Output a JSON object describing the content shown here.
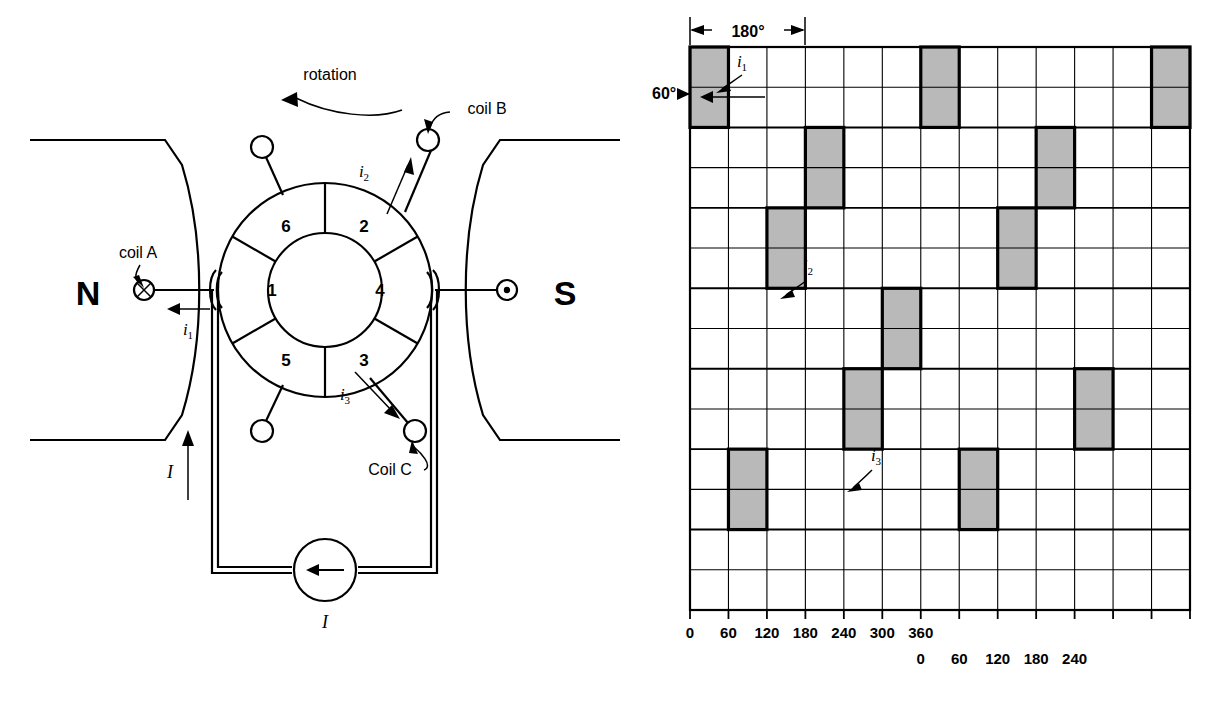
{
  "figure": {
    "title_left": "DC machine cross-section with ring armature",
    "title_right": "Coil current timing diagram"
  },
  "left_diagram": {
    "name": "dc-machine-cross-section",
    "rotation_label": "rotation",
    "pole_north": "N",
    "pole_south": "S",
    "coil_a_label": "coil A",
    "coil_b_label": "coil B",
    "coil_c_label": "Coil C",
    "current_i1": "i",
    "current_i1_sub": "1",
    "current_i2": "i",
    "current_i2_sub": "2",
    "current_i3": "i",
    "current_i3_sub": "3",
    "current_I_side": "I",
    "current_I_source": "I",
    "segment_numbers": [
      "1",
      "2",
      "3",
      "4",
      "5",
      "6"
    ],
    "segment_positions": {
      "1": "left",
      "2": "upper-right",
      "3": "lower-right",
      "4": "right",
      "5": "lower-left",
      "6": "upper-left"
    },
    "brush_left_symbol": "cross-in-circle",
    "brush_right_symbol": "dot-in-circle"
  },
  "right_diagram": {
    "name": "coil-current-timing-grid",
    "dim_180_label": "180°",
    "dim_60_label": "60°",
    "trace_labels": [
      {
        "text": "i",
        "sub": "1"
      },
      {
        "text": "i",
        "sub": "2"
      },
      {
        "text": "i",
        "sub": "3"
      }
    ],
    "axis_top_ticks": [
      "0",
      "60",
      "120",
      "180",
      "240",
      "300",
      "360"
    ],
    "axis_bottom_ticks": [
      "0",
      "60",
      "120",
      "180",
      "240"
    ],
    "grid": {
      "columns": 13,
      "rows": 14,
      "degrees_per_column": 60,
      "shade_color": "#b9b9b9",
      "line_color": "#000000"
    }
  },
  "chart_data": {
    "type": "bar",
    "xlabel": "Rotor angle (degrees)",
    "ylabel": "Coil current pulses",
    "xlim": [
      0,
      780
    ],
    "grid": true,
    "legend": "none",
    "categories": [
      "0",
      "60",
      "120",
      "180",
      "240",
      "300",
      "360",
      "420",
      "480",
      "540",
      "600",
      "660",
      "720"
    ],
    "series": [
      {
        "name": "i1",
        "row_band": 1,
        "pulse_columns": [
          0,
          6,
          12
        ],
        "values": [
          1,
          0,
          0,
          0,
          0,
          0,
          1,
          0,
          0,
          0,
          0,
          0,
          1
        ]
      },
      {
        "name": "band2",
        "row_band": 2,
        "pulse_columns": [
          3,
          9
        ],
        "values": [
          0,
          0,
          0,
          1,
          0,
          0,
          0,
          0,
          0,
          1,
          0,
          0,
          0
        ]
      },
      {
        "name": "i2",
        "row_band": 3,
        "pulse_columns": [
          2,
          8
        ],
        "values": [
          0,
          0,
          1,
          0,
          0,
          0,
          0,
          0,
          1,
          0,
          0,
          0,
          0
        ]
      },
      {
        "name": "band4",
        "row_band": 4,
        "pulse_columns": [
          5
        ],
        "values": [
          0,
          0,
          0,
          0,
          0,
          1,
          0,
          0,
          0,
          0,
          0,
          0,
          0
        ]
      },
      {
        "name": "i3",
        "row_band": 5,
        "pulse_columns": [
          4,
          10
        ],
        "values": [
          0,
          0,
          0,
          0,
          1,
          0,
          0,
          0,
          0,
          0,
          1,
          0,
          0
        ]
      },
      {
        "name": "band6",
        "row_band": 6,
        "pulse_columns": [
          1,
          7
        ],
        "values": [
          0,
          1,
          0,
          0,
          0,
          0,
          0,
          1,
          0,
          0,
          0,
          0,
          0
        ]
      }
    ]
  }
}
